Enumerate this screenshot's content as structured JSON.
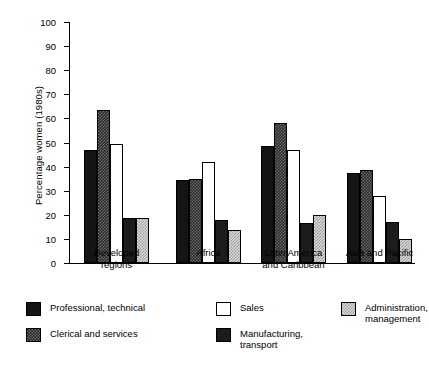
{
  "chart_data": {
    "type": "bar",
    "title": "",
    "xlabel": "",
    "ylabel": "Percentage women (1980s)",
    "ylim": [
      0,
      100
    ],
    "ytick_labels": [
      "100",
      "90",
      "80",
      "70",
      "60",
      "50",
      "40",
      "30",
      "20",
      "10",
      "0"
    ],
    "yticks": [
      100,
      90,
      80,
      70,
      60,
      50,
      40,
      30,
      20,
      10,
      0
    ],
    "grid": false,
    "legend_position": "bottom",
    "categories": [
      "Developed regions",
      "Africa",
      "Latin America and Caribbean",
      "Asia and Pacific"
    ],
    "series": [
      {
        "name": "Professional, technical",
        "pattern": "solid-black",
        "values": [
          47,
          34.5,
          48.5,
          37.5
        ]
      },
      {
        "name": "Clerical and services",
        "pattern": "checkered-dark",
        "values": [
          63.5,
          35,
          58,
          38.5
        ]
      },
      {
        "name": "Sales",
        "pattern": "white",
        "values": [
          49.5,
          42,
          47,
          28
        ]
      },
      {
        "name": "Manufacturing, transport",
        "pattern": "dark",
        "values": [
          18.5,
          18,
          16.5,
          17
        ]
      },
      {
        "name": "Administration, management",
        "pattern": "checkered-light",
        "values": [
          18.5,
          13.5,
          20,
          10
        ]
      }
    ]
  },
  "axis": {
    "y_title": "Percentage women (1980s)"
  },
  "categories": [
    {
      "line1": "Developed",
      "line2": "regions"
    },
    {
      "line1": "Africa",
      "line2": ""
    },
    {
      "line1": "Latin America",
      "line2": "and Caribbean"
    },
    {
      "line1": "Asia and Pacific",
      "line2": ""
    }
  ],
  "legend": [
    {
      "label": "Professional, technical"
    },
    {
      "label": "Clerical and services"
    },
    {
      "label": "Sales"
    },
    {
      "label": "Manufacturing,\ntransport"
    },
    {
      "label": "Administration,\nmanagement"
    }
  ]
}
